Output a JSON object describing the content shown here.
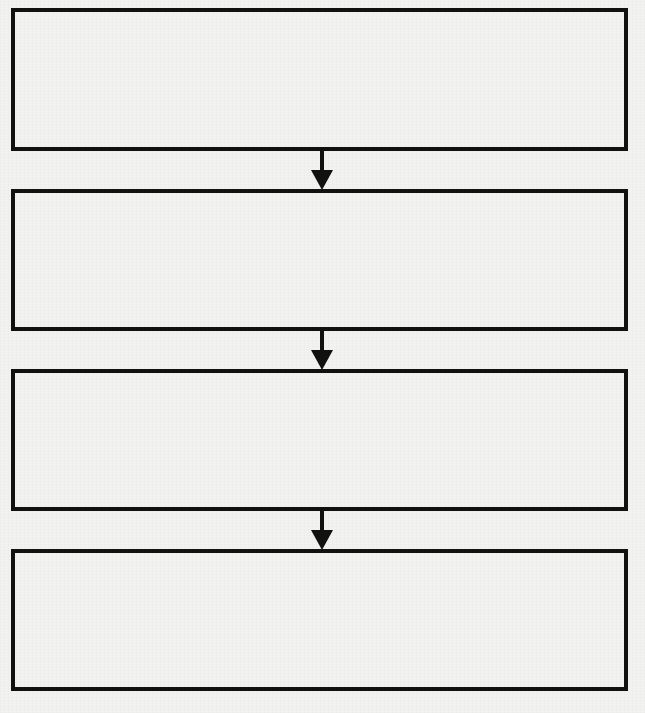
{
  "diagram": {
    "type": "vertical-flowchart",
    "colors": {
      "background": "#f2f2f1",
      "stroke": "#111111"
    },
    "boxes": [
      {
        "step": 1,
        "text": ""
      },
      {
        "step": 2,
        "text": ""
      },
      {
        "step": 3,
        "text": ""
      },
      {
        "step": 4,
        "text": ""
      }
    ],
    "connectors": [
      {
        "from": 1,
        "to": 2,
        "direction": "down"
      },
      {
        "from": 2,
        "to": 3,
        "direction": "down"
      },
      {
        "from": 3,
        "to": 4,
        "direction": "down"
      }
    ]
  }
}
